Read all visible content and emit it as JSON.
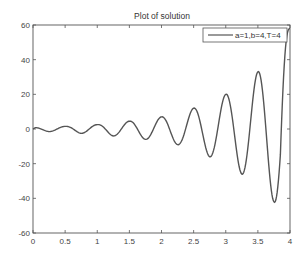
{
  "chart_data": {
    "type": "line",
    "title": "Plot of solution",
    "xlabel": "",
    "ylabel": "",
    "xlim": [
      0,
      4
    ],
    "ylim": [
      -60,
      60
    ],
    "xticks": [
      0,
      0.5,
      1,
      1.5,
      2,
      2.5,
      3,
      3.5,
      4
    ],
    "xtick_labels": [
      "0",
      "0.5",
      "1",
      "1.5",
      "2",
      "2.5",
      "3",
      "3.5",
      "4"
    ],
    "yticks": [
      -60,
      -40,
      -20,
      0,
      20,
      40,
      60
    ],
    "ytick_labels": [
      "-60",
      "-40",
      "-20",
      "0",
      "20",
      "40",
      "60"
    ],
    "grid": false,
    "legend_position": "upper right",
    "series": [
      {
        "name": "a=1,b=4,T=4",
        "color": "#555555",
        "x": [
          0,
          0.05,
          0.25,
          0.5,
          0.75,
          1.0,
          1.25,
          1.5,
          1.75,
          2.0,
          2.25,
          2.5,
          2.75,
          3.0,
          3.25,
          3.5,
          3.75,
          4.0
        ],
        "values": [
          0,
          1,
          -1.5,
          1.5,
          -2.5,
          2.5,
          -4,
          4.5,
          -6,
          7,
          -9,
          12,
          -16,
          20,
          -26,
          33,
          -42,
          58
        ]
      }
    ]
  }
}
